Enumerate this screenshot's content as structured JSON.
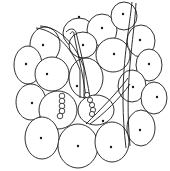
{
  "illustration": {
    "subject": "line-art cluster of oval cells with dots and curved strands",
    "colors": {
      "background": "#ffffff",
      "stroke": "#1a1a1a"
    },
    "cells": [
      {
        "cx": 79,
        "cy": 33,
        "rx": 16,
        "ry": 15,
        "dx": 79,
        "dy": 17
      },
      {
        "cx": 102,
        "cy": 30,
        "rx": 15,
        "ry": 16,
        "dx": 102,
        "dy": 28
      },
      {
        "cx": 124,
        "cy": 16,
        "rx": 13,
        "ry": 14,
        "dx": 123,
        "dy": 14
      },
      {
        "cx": 45,
        "cy": 45,
        "rx": 15,
        "ry": 18,
        "dx": 43,
        "dy": 45
      },
      {
        "cx": 83,
        "cy": 45,
        "rx": 14,
        "ry": 13,
        "dx": 83,
        "dy": 45
      },
      {
        "cx": 113,
        "cy": 55,
        "rx": 17,
        "ry": 17,
        "dx": 114,
        "dy": 54
      },
      {
        "cx": 141,
        "cy": 41,
        "rx": 14,
        "ry": 16,
        "dx": 140,
        "dy": 40
      },
      {
        "cx": 28,
        "cy": 65,
        "rx": 14,
        "ry": 19,
        "dx": 26,
        "dy": 64
      },
      {
        "cx": 52,
        "cy": 74,
        "rx": 17,
        "ry": 17,
        "dx": 47,
        "dy": 74
      },
      {
        "cx": 86,
        "cy": 78,
        "rx": 17,
        "ry": 20,
        "dx": 77,
        "dy": 86
      },
      {
        "cx": 149,
        "cy": 65,
        "rx": 13,
        "ry": 16,
        "dx": 149,
        "dy": 64
      },
      {
        "cx": 132,
        "cy": 86,
        "rx": 14,
        "ry": 16,
        "dx": 133,
        "dy": 87
      },
      {
        "cx": 154,
        "cy": 98,
        "rx": 13,
        "ry": 16,
        "dx": 157,
        "dy": 97
      },
      {
        "cx": 31,
        "cy": 102,
        "rx": 15,
        "ry": 18,
        "dx": 32,
        "dy": 103
      },
      {
        "cx": 58,
        "cy": 110,
        "rx": 19,
        "ry": 19,
        "dx": 60,
        "dy": 110
      },
      {
        "cx": 96,
        "cy": 110,
        "rx": 18,
        "ry": 15,
        "dx": 103,
        "dy": 121
      },
      {
        "cx": 141,
        "cy": 128,
        "rx": 14,
        "ry": 18,
        "dx": 140,
        "dy": 130
      },
      {
        "cx": 42,
        "cy": 138,
        "rx": 17,
        "ry": 21,
        "dx": 41,
        "dy": 138
      },
      {
        "cx": 78,
        "cy": 146,
        "rx": 20,
        "ry": 22,
        "dx": 78,
        "dy": 146
      },
      {
        "cx": 112,
        "cy": 142,
        "rx": 17,
        "ry": 20,
        "dx": 111,
        "dy": 147
      }
    ],
    "strands": [
      "M36,28 C55,30 72,48 80,70 L80,98",
      "M40,26 C60,27 76,45 84,68 L84,98",
      "M66,32 C70,28 74,28 76,32 C80,50 86,72 90,98",
      "M70,34 C72,31 74,31 74,34 C77,52 83,72 86,98",
      "M132,2 C128,40 118,80 126,148",
      "M136,3 C134,40 124,82 130,146",
      "M128,78 C118,92 100,110 86,124",
      "M130,84 C120,98 104,114 90,124"
    ],
    "bead_strings": [
      {
        "beads": [
          [
            62,
            96
          ],
          [
            62,
            101
          ],
          [
            62,
            106
          ],
          [
            62,
            111
          ],
          [
            60,
            116
          ]
        ],
        "r": 2.8
      },
      {
        "beads": [
          [
            87,
            95
          ],
          [
            90,
            100
          ],
          [
            92,
            105
          ],
          [
            93,
            110
          ],
          [
            92,
            114
          ]
        ],
        "r": 2.6
      }
    ]
  }
}
